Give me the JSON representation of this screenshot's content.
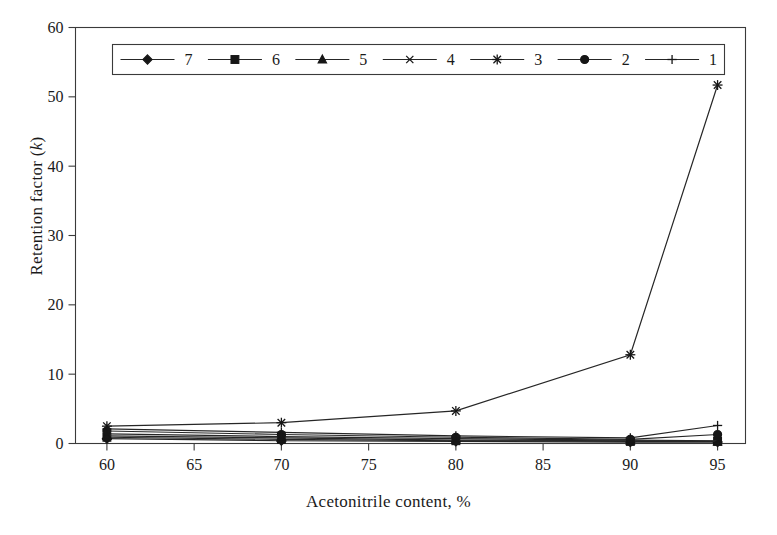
{
  "figure": {
    "title": "",
    "background": "#ffffff",
    "ink_color": "#262626"
  },
  "axes": {
    "x": {
      "label": "Acetonitrile content, %",
      "ticks": [
        "60",
        "65",
        "70",
        "75",
        "80",
        "85",
        "90",
        "95"
      ],
      "min": 58.2,
      "max": 96.6
    },
    "y": {
      "label_prefix": "Retention factor (",
      "label_italic": "k",
      "label_suffix": ")",
      "label": "Retention factor (k)",
      "ticks": [
        "0",
        "10",
        "20",
        "30",
        "40",
        "50",
        "60"
      ],
      "min": 0,
      "max": 60
    }
  },
  "legend": {
    "position": "inside-top",
    "orientation": "horizontal",
    "entries": [
      {
        "label": "7",
        "marker": "diamond-marker"
      },
      {
        "label": "6",
        "marker": "square-marker"
      },
      {
        "label": "5",
        "marker": "triangle-marker"
      },
      {
        "label": "4",
        "marker": "cross-x-marker"
      },
      {
        "label": "3",
        "marker": "asterisk-marker"
      },
      {
        "label": "2",
        "marker": "circle-marker"
      },
      {
        "label": "1",
        "marker": "plus-marker"
      }
    ]
  },
  "chart_data": {
    "type": "line",
    "title": "",
    "xlabel": "Acetonitrile content, %",
    "ylabel": "Retention factor (k)",
    "xlim": [
      58.2,
      96.6
    ],
    "ylim": [
      0,
      60
    ],
    "xticks": [
      60,
      65,
      70,
      75,
      80,
      85,
      90,
      95
    ],
    "yticks": [
      0,
      10,
      20,
      30,
      40,
      50,
      60
    ],
    "grid": false,
    "legend_position": "inside-top",
    "x": [
      60,
      70,
      80,
      90,
      95
    ],
    "series": [
      {
        "name": "7",
        "marker": "diamond",
        "values": [
          0.7,
          0.4,
          0.3,
          0.2,
          0.2
        ]
      },
      {
        "name": "6",
        "marker": "square",
        "values": [
          0.9,
          0.6,
          0.4,
          0.3,
          0.3
        ]
      },
      {
        "name": "5",
        "marker": "triangle",
        "values": [
          1.1,
          0.8,
          0.5,
          0.4,
          0.3
        ]
      },
      {
        "name": "4",
        "marker": "cross-x",
        "values": [
          1.4,
          1.0,
          0.7,
          0.5,
          0.4
        ]
      },
      {
        "name": "3",
        "marker": "asterisk",
        "values": [
          2.5,
          3.0,
          4.7,
          12.8,
          51.7
        ]
      },
      {
        "name": "2",
        "marker": "circle",
        "values": [
          1.8,
          1.3,
          0.9,
          0.6,
          1.3
        ]
      },
      {
        "name": "1",
        "marker": "plus",
        "values": [
          2.1,
          1.6,
          1.1,
          0.8,
          2.6
        ]
      }
    ]
  }
}
